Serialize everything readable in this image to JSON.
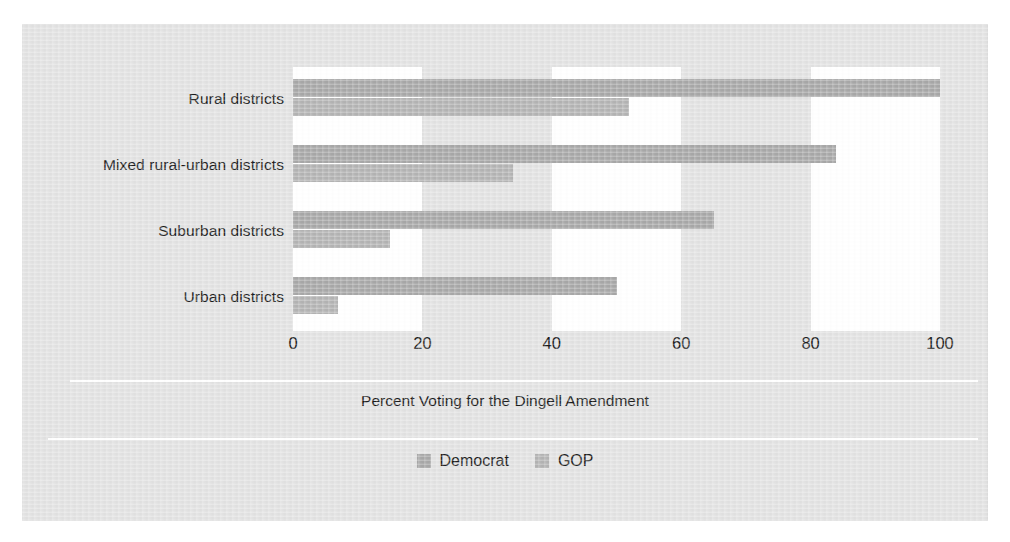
{
  "figure": {
    "background_color": "#e2e2e2",
    "page_color": "#ffffff"
  },
  "chart_data": {
    "type": "bar",
    "orientation": "horizontal",
    "title": "",
    "subtitle": "",
    "xlabel": "Percent Voting for the Dingell Amendment",
    "ylabel": "",
    "categories": [
      "Rural districts",
      "Mixed rural-urban districts",
      "Suburban districts",
      "Urban districts"
    ],
    "series": [
      {
        "name": "Democrat",
        "color": "#a8a8a8",
        "values": [
          100,
          84,
          65,
          50
        ]
      },
      {
        "name": "GOP",
        "color": "#b4b4b4",
        "values": [
          52,
          34,
          15,
          7
        ]
      }
    ],
    "xlim": [
      0,
      100
    ],
    "xticks": [
      0,
      20,
      40,
      60,
      80,
      100
    ],
    "xtick_labels": [
      "0",
      "20",
      "40",
      "60",
      "80",
      "100"
    ],
    "grid": "vertical-white-bands",
    "legend_position": "bottom-center",
    "legend_entries": [
      "Democrat",
      "GOP"
    ]
  }
}
